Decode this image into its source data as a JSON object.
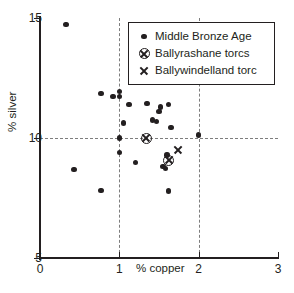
{
  "chart_data": {
    "type": "scatter",
    "title": "",
    "xlabel": "% copper",
    "ylabel": "% silver",
    "xlim": [
      0,
      3
    ],
    "ylim": [
      5,
      15
    ],
    "xticks": [
      "0",
      "1",
      "2",
      "3"
    ],
    "yticks": [
      "15",
      "10",
      "5"
    ],
    "xtick_values": [
      0,
      1,
      2,
      3
    ],
    "ytick_values": [
      15,
      10,
      5
    ],
    "grid": "dashed gridlines at x=1, x=2 and y=10",
    "gridlines_x": [
      1,
      2
    ],
    "gridlines_y": [
      10
    ],
    "legend_position": "top-right inside plot",
    "series": [
      {
        "name": "Middle Bronze Age",
        "marker": "filled-circle",
        "color": "#231f20",
        "points": [
          [
            0.33,
            14.72
          ],
          [
            0.43,
            8.68
          ],
          [
            0.77,
            11.85
          ],
          [
            0.77,
            7.82
          ],
          [
            0.92,
            11.72
          ],
          [
            1.0,
            11.95
          ],
          [
            1.0,
            11.72
          ],
          [
            1.05,
            10.62
          ],
          [
            1.0,
            10.0
          ],
          [
            1.0,
            9.4
          ],
          [
            1.12,
            11.4
          ],
          [
            1.2,
            8.98
          ],
          [
            1.35,
            11.45
          ],
          [
            1.42,
            10.75
          ],
          [
            1.47,
            10.68
          ],
          [
            1.5,
            11.1
          ],
          [
            1.52,
            11.3
          ],
          [
            1.55,
            8.82
          ],
          [
            1.58,
            8.72
          ],
          [
            1.6,
            9.3
          ],
          [
            1.62,
            11.4
          ],
          [
            1.65,
            10.45
          ],
          [
            1.62,
            7.8
          ],
          [
            2.0,
            10.12
          ]
        ]
      },
      {
        "name": "Ballyrashane torcs",
        "marker": "circled-x",
        "color": "#231f20",
        "points": [
          [
            1.34,
            10.0
          ],
          [
            1.62,
            9.08
          ]
        ]
      },
      {
        "name": "Ballywindelland torc",
        "marker": "x",
        "color": "#231f20",
        "points": [
          [
            1.74,
            9.5
          ]
        ]
      }
    ]
  },
  "legend": {
    "items": [
      {
        "label": "Middle Bronze Age",
        "marker": "filled-circle"
      },
      {
        "label": "Ballyrashane torcs",
        "marker": "circled-x"
      },
      {
        "label": "Ballywindelland torc",
        "marker": "x"
      }
    ]
  }
}
